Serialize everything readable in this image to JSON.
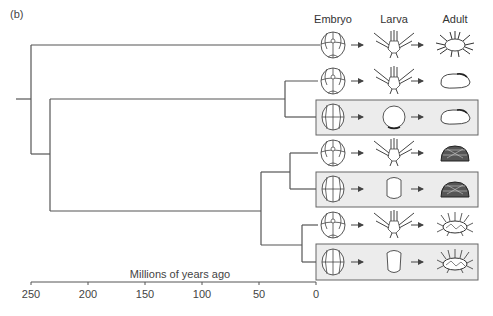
{
  "panel_label": "(b)",
  "columns": [
    "Embryo",
    "Larva",
    "Adult"
  ],
  "axis": {
    "title": "Millions of years ago",
    "ticks": [
      "250",
      "200",
      "150",
      "100",
      "50",
      "0"
    ]
  },
  "taxa": [
    {
      "row": 1,
      "embryo": "cleaving embryo (4-cell pattern)",
      "larva": "pluteus with long arms",
      "adult": "spiny sea urchin",
      "highlighted": false
    },
    {
      "row": 2,
      "embryo": "cleaving embryo (4-cell pattern)",
      "larva": "pluteus with many arms",
      "adult": "oval heart urchin",
      "highlighted": false
    },
    {
      "row": 3,
      "embryo": "cleaving embryo (equal cells)",
      "larva": "round non-feeding larva",
      "adult": "oval heart urchin",
      "highlighted": true
    },
    {
      "row": 4,
      "embryo": "cleaving embryo (4-cell pattern)",
      "larva": "pluteus with short arms",
      "adult": "dense-spined urchin",
      "highlighted": false
    },
    {
      "row": 5,
      "embryo": "cleaving embryo (equal cells)",
      "larva": "barrel non-feeding larva",
      "adult": "dense-spined urchin",
      "highlighted": true
    },
    {
      "row": 6,
      "embryo": "cleaving embryo (4-cell pattern)",
      "larva": "pluteus with long arms",
      "adult": "long-spined urchin",
      "highlighted": false
    },
    {
      "row": 7,
      "embryo": "cleaving embryo (equal cells)",
      "larva": "barrel non-feeding larva",
      "adult": "long-spined urchin",
      "highlighted": true
    }
  ],
  "colors": {
    "line": "#555555",
    "highlight_box": "#ececec",
    "box_border": "#666666"
  }
}
